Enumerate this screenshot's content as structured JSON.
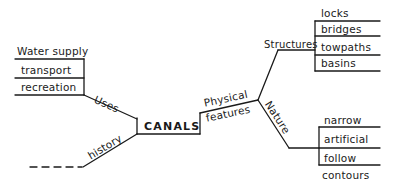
{
  "diagram": {
    "type": "mind-map",
    "center": "CANALS",
    "branches": {
      "uses": {
        "label": "Uses",
        "items": [
          "Water supply",
          "transport",
          "recreation"
        ]
      },
      "history": {
        "label": "history",
        "continuation": "- - -"
      },
      "physical_features": {
        "label_line1": "Physical",
        "label_line2": "features",
        "structures": {
          "label": "Structures",
          "items": [
            "locks",
            "bridges",
            "towpaths",
            "basins"
          ]
        },
        "nature": {
          "label": "Nature",
          "items": [
            "narrow",
            "artificial",
            "follow",
            "contours"
          ]
        }
      }
    },
    "colors": {
      "ink": "#1a1a1a",
      "background": "#ffffff"
    }
  }
}
